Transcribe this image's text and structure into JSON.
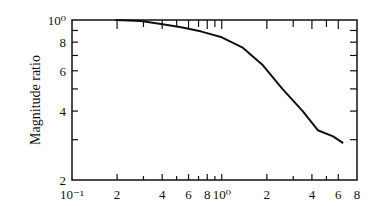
{
  "chart_data": {
    "type": "line",
    "title": "",
    "xlabel": "",
    "ylabel": "Magnitude ratio",
    "xscale": "log",
    "yscale": "log",
    "xlim": [
      0.1,
      8
    ],
    "ylim": [
      0.2,
      1.0
    ],
    "grid": false,
    "legend": null,
    "x_ticks": [
      {
        "value": 0.1,
        "label": "10⁻¹"
      },
      {
        "value": 0.2,
        "label": "2"
      },
      {
        "value": 0.4,
        "label": "4"
      },
      {
        "value": 0.6,
        "label": "6"
      },
      {
        "value": 0.8,
        "label": "8"
      },
      {
        "value": 1.0,
        "label": "10⁰"
      },
      {
        "value": 2.0,
        "label": "2"
      },
      {
        "value": 4.0,
        "label": "4"
      },
      {
        "value": 6.0,
        "label": "6"
      },
      {
        "value": 8.0,
        "label": "8"
      }
    ],
    "x_minor_ticks": [
      0.3,
      0.5,
      0.7,
      0.9,
      3.0,
      5.0
    ],
    "y_ticks": [
      {
        "value": 1.0,
        "label": "10⁰"
      },
      {
        "value": 0.8,
        "label": "8"
      },
      {
        "value": 0.6,
        "label": "6"
      },
      {
        "value": 0.4,
        "label": "4"
      },
      {
        "value": 0.2,
        "label": "2"
      }
    ],
    "y_minor_ticks": [
      0.9,
      0.7,
      0.5,
      0.3
    ],
    "series": [
      {
        "name": "Magnitude ratio",
        "x": [
          0.195,
          0.288,
          0.393,
          0.537,
          0.733,
          1.0,
          1.37,
          1.86,
          2.54,
          3.47,
          4.38,
          5.54,
          6.47
        ],
        "y": [
          1.0,
          0.99,
          0.96,
          0.93,
          0.89,
          0.84,
          0.76,
          0.64,
          0.5,
          0.4,
          0.33,
          0.31,
          0.29
        ]
      }
    ]
  }
}
